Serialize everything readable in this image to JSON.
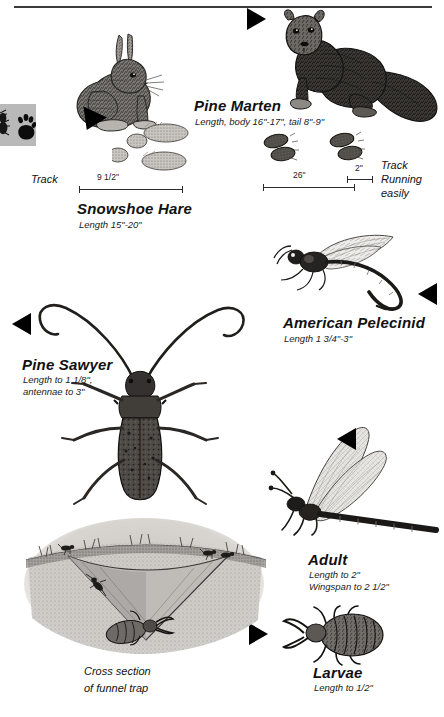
{
  "page": {
    "width": 444,
    "height": 717,
    "background": "#ffffff",
    "ink": "#111111"
  },
  "header": {
    "rule": "horizontal-rule"
  },
  "tab_icon": {
    "name": "animal-tracks-tab-icon",
    "background": "#b9b9b9",
    "glyphs": [
      "insect-silhouette",
      "paw-print"
    ]
  },
  "entries": [
    {
      "id": "snowshoe-hare",
      "name": "Snowshoe Hare",
      "sub": "Length 15\"-20\"",
      "illustration": "snowshoe-hare-illustration",
      "track_label": "Track",
      "measure": {
        "label": "9 1/2\""
      }
    },
    {
      "id": "pine-marten",
      "name": "Pine Marten",
      "sub": "Length, body 16\"-17\", tail 8\"-9\"",
      "illustration": "pine-marten-illustration",
      "track_caption": "Track\nRunning\neasily",
      "track_caption_lines": [
        "Track",
        "Running",
        "easily"
      ],
      "measures": [
        {
          "label": "26\""
        },
        {
          "label": "2\""
        }
      ]
    },
    {
      "id": "american-pelecinid",
      "name": "American Pelecinid",
      "sub": "Length 1 3/4\"-3\"",
      "illustration": "american-pelecinid-illustration"
    },
    {
      "id": "pine-sawyer",
      "name": "Pine Sawyer",
      "sub_lines": [
        "Length to 1 1/8\",",
        "antennae to 3\""
      ],
      "illustration": "pine-sawyer-illustration"
    },
    {
      "id": "antlion-adult",
      "name": "Adult",
      "sub_lines": [
        "Length to 2\"",
        "Wingspan to 2 1/2\""
      ],
      "illustration": "antlion-adult-illustration"
    },
    {
      "id": "antlion-larvae",
      "name": "Larvae",
      "sub_lines": [
        "Length to 1/2\""
      ],
      "illustration": "antlion-larvae-illustration"
    },
    {
      "id": "funnel-trap",
      "caption_lines": [
        "Cross section",
        "of funnel trap"
      ],
      "illustration": "funnel-trap-illustration"
    }
  ]
}
